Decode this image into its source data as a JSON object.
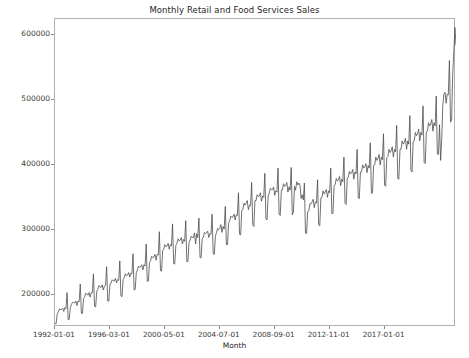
{
  "chart_data": {
    "type": "line",
    "title": "Monthly Retail and Food Services Sales",
    "xlabel": "Month",
    "ylabel": "$MM Sales",
    "grid": false,
    "legend": null,
    "line_color": "#4d4d4d",
    "line_width": 0.8,
    "ylim": [
      150000,
      625000
    ],
    "ytick_labels": [
      "200000",
      "300000",
      "400000",
      "500000",
      "600000"
    ],
    "ytick_values": [
      200000,
      300000,
      400000,
      500000,
      600000
    ],
    "xtick_labels": [
      "1992-01-01",
      "1996-03-01",
      "2000-05-01",
      "2004-07-01",
      "2008-09-01",
      "2012-11-01",
      "2017-01-01"
    ],
    "xtick_indices": [
      0,
      50,
      100,
      150,
      200,
      250,
      300
    ],
    "x_start": "1992-01-01",
    "x_end": "2021-04-01",
    "n_points": 352,
    "series_name": "Retail and Food Services Sales",
    "values": [
      156000,
      155000,
      170000,
      173000,
      178000,
      177000,
      177000,
      179000,
      174000,
      180000,
      178000,
      203000,
      161000,
      162000,
      180000,
      185000,
      188000,
      188000,
      187000,
      190000,
      183000,
      190000,
      189000,
      216000,
      171000,
      171000,
      194000,
      196000,
      202000,
      201000,
      199000,
      203000,
      196000,
      203000,
      203000,
      232000,
      182000,
      181000,
      205000,
      208000,
      214000,
      212000,
      211000,
      215000,
      207000,
      213000,
      214000,
      243000,
      190000,
      190000,
      215000,
      218000,
      223000,
      221000,
      221000,
      225000,
      218000,
      223000,
      222000,
      252000,
      198000,
      197000,
      223000,
      226000,
      232000,
      229000,
      230000,
      234000,
      227000,
      233000,
      232000,
      263000,
      207000,
      208000,
      234000,
      238000,
      244000,
      242000,
      243000,
      246000,
      238000,
      246000,
      244000,
      278000,
      220000,
      221000,
      249000,
      252000,
      259000,
      257000,
      258000,
      262000,
      253000,
      262000,
      261000,
      297000,
      237000,
      236000,
      268000,
      270000,
      277000,
      274000,
      275000,
      279000,
      270000,
      277000,
      275000,
      309000,
      248000,
      247000,
      276000,
      279000,
      286000,
      283000,
      284000,
      288000,
      278000,
      285000,
      282000,
      314000,
      251000,
      251000,
      280000,
      284000,
      290000,
      288000,
      288000,
      295000,
      278000,
      294000,
      288000,
      318000,
      257000,
      257000,
      287000,
      288000,
      296000,
      294000,
      295000,
      298000,
      288000,
      294000,
      293000,
      324000,
      263000,
      262000,
      290000,
      296000,
      302000,
      300000,
      302000,
      308000,
      296000,
      305000,
      301000,
      336000,
      277000,
      277000,
      310000,
      314000,
      321000,
      319000,
      320000,
      324000,
      315000,
      323000,
      322000,
      357000,
      293000,
      292000,
      330000,
      331000,
      341000,
      338000,
      341000,
      345000,
      331000,
      338000,
      337000,
      373000,
      308000,
      305000,
      345000,
      345000,
      354000,
      351000,
      352000,
      357000,
      344000,
      352000,
      350000,
      387000,
      317000,
      315000,
      352000,
      356000,
      364000,
      362000,
      362000,
      366000,
      353000,
      360000,
      358000,
      395000,
      324000,
      322000,
      361000,
      361000,
      371000,
      367000,
      368000,
      373000,
      358000,
      366000,
      361000,
      396000,
      323000,
      327000,
      367000,
      361000,
      374000,
      369000,
      372000,
      369000,
      348000,
      354000,
      346000,
      372000,
      295000,
      294000,
      328000,
      329000,
      340000,
      340000,
      343000,
      347000,
      334000,
      343000,
      341000,
      377000,
      308000,
      306000,
      349000,
      350000,
      360000,
      355000,
      358000,
      362000,
      350000,
      360000,
      357000,
      395000,
      325000,
      325000,
      367000,
      370000,
      379000,
      375000,
      377000,
      382000,
      368000,
      378000,
      374000,
      412000,
      341000,
      339000,
      380000,
      381000,
      390000,
      386000,
      388000,
      393000,
      378000,
      389000,
      386000,
      424000,
      349000,
      348000,
      389000,
      389000,
      400000,
      395000,
      397000,
      402000,
      388000,
      399000,
      395000,
      434000,
      356000,
      357000,
      399000,
      400000,
      412000,
      407000,
      410000,
      416000,
      400000,
      412000,
      408000,
      448000,
      369000,
      367000,
      411000,
      413000,
      424000,
      419000,
      422000,
      428000,
      412000,
      424000,
      420000,
      461000,
      379000,
      378000,
      424000,
      424000,
      437000,
      432000,
      435000,
      441000,
      424000,
      437000,
      432000,
      476000,
      391000,
      389000,
      436000,
      437000,
      450000,
      445000,
      448000,
      455000,
      437000,
      450000,
      446000,
      491000,
      404000,
      402000,
      451000,
      452000,
      465000,
      460000,
      463000,
      470000,
      452000,
      465000,
      460000,
      506000,
      417000,
      416000,
      462000,
      407000,
      440000,
      492000,
      509000,
      512000,
      495000,
      509000,
      508000,
      561000,
      466000,
      469000,
      540000,
      573000,
      612000,
      585000
    ]
  }
}
